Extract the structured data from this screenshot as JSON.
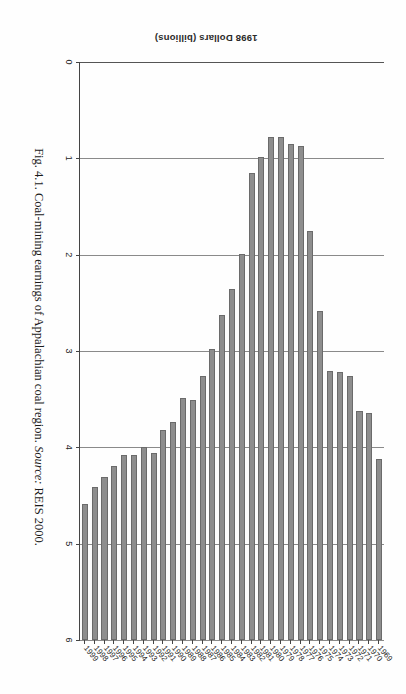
{
  "figure": {
    "caption_prefix": "Fig. 4.1. Coal-mining earnings of Appalachian coal region.",
    "source_label": "Source:",
    "source_value": "REIS 2000."
  },
  "axes": {
    "value_axis_title": "1998 Dollars (billions)",
    "value_ticks": [
      "0",
      "1",
      "2",
      "3",
      "4",
      "5",
      "6"
    ],
    "value_min": 0,
    "value_max": 6
  },
  "colors": {
    "bar_fill": "#8e8e8e",
    "bar_stroke": "#6b6b6b",
    "gridline": "#8a8a8a",
    "axis": "#444444",
    "page_background": "#fefefe"
  },
  "chart_data": {
    "type": "bar",
    "orientation": "vertical",
    "title": "Coal-mining earnings of Appalachian coal region",
    "xlabel": "",
    "ylabel": "1998 Dollars (billions)",
    "ylim": [
      0,
      6
    ],
    "grid": true,
    "legend": "none",
    "categories": [
      "1969",
      "1970",
      "1971",
      "1972",
      "1973",
      "1974",
      "1975",
      "1976",
      "1977",
      "1978",
      "1979",
      "1980",
      "1981",
      "1982",
      "1983",
      "1984",
      "1985",
      "1986",
      "1987",
      "1988",
      "1989",
      "1990",
      "1991",
      "1992",
      "1993",
      "1994",
      "1995",
      "1996",
      "1997",
      "1998",
      "1999"
    ],
    "values": [
      1.88,
      2.36,
      2.38,
      2.74,
      2.78,
      2.79,
      3.42,
      4.25,
      5.13,
      5.15,
      5.22,
      5.22,
      5.01,
      4.85,
      4.01,
      3.64,
      3.37,
      3.02,
      2.74,
      2.49,
      2.51,
      2.26,
      2.18,
      1.94,
      2.0,
      1.92,
      1.92,
      1.81,
      1.69,
      1.59,
      1.41
    ]
  }
}
